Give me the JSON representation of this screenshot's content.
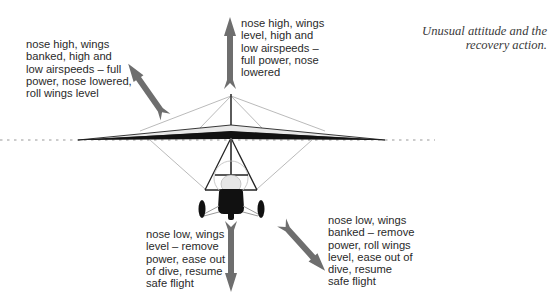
{
  "caption": "Unusual attitude and the\nrecovery action.",
  "labels": {
    "nose_high_banked": "nose high, wings\nbanked, high and\nlow airspeeds – full\npower, nose lowered,\nroll wings level",
    "nose_high_level": "nose high, wings\nlevel, high and\nlow airspeeds –\nfull power, nose\nlowered",
    "nose_low_level": "nose low, wings\nlevel – remove\npower, ease out\nof dive, resume\nsafe flight",
    "nose_low_banked": "nose low, wings\nbanked – remove\npower, roll wings\nlevel, ease out of\ndive, resume\nsafe flight"
  },
  "colors": {
    "arrow": "#6e6e6e",
    "wing_dark": "#111111",
    "wing_light": "#e8e8e8",
    "rigging": "#9a9a9a",
    "horizon": "#9a9a9a"
  }
}
